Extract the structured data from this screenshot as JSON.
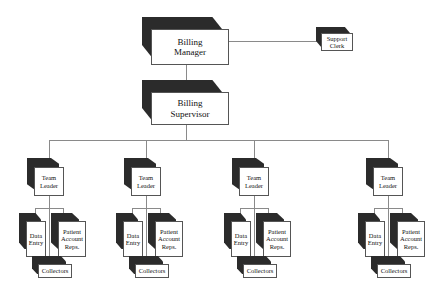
{
  "diagram": {
    "type": "org-chart",
    "nodes": {
      "manager": {
        "label": "Billing\nManager",
        "line1": "Billing",
        "line2": "Manager"
      },
      "clerk": {
        "line1": "Support",
        "line2": "Clerk"
      },
      "supervisor": {
        "line1": "Billing",
        "line2": "Supervisor"
      }
    },
    "teams": [
      {
        "leader1": "Team",
        "leader2": "Leader",
        "entry1": "Data",
        "entry2": "Entry",
        "rep1": "Patient",
        "rep2": "Account",
        "rep3": "Reps.",
        "collectors": "Collectors"
      },
      {
        "leader1": "Team",
        "leader2": "Leader",
        "entry1": "Data",
        "entry2": "Entry",
        "rep1": "Patient",
        "rep2": "Account",
        "rep3": "Reps.",
        "collectors": "Collectors"
      },
      {
        "leader1": "Team",
        "leader2": "Leader",
        "entry1": "Data",
        "entry2": "Entry",
        "rep1": "Patient",
        "rep2": "Account",
        "rep3": "Reps.",
        "collectors": "Collectors"
      },
      {
        "leader1": "Team",
        "leader2": "Leader",
        "entry1": "Data",
        "entry2": "Entry",
        "rep1": "Patient",
        "rep2": "Account",
        "rep3": "Reps.",
        "collectors": "Collectors"
      }
    ],
    "colors": {
      "box_shadow": "#2b2b2b",
      "box_face": "#ffffff",
      "connector": "#8a8a8a"
    }
  }
}
